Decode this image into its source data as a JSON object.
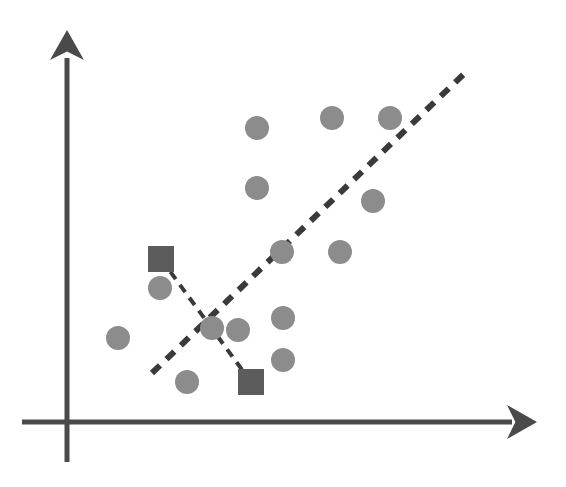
{
  "figure": {
    "background_color": "#ffffff",
    "width": 566,
    "height": 487
  },
  "colors": {
    "axis": "#4a4a4a",
    "dot": "#8c8c8c",
    "square": "#5c5c5c",
    "dash": "#3a3a3a",
    "background": "#ffffff"
  },
  "axes": {
    "x_axis": {
      "name": "horizontal-axis",
      "x1": 22,
      "y1": 422,
      "x2": 512,
      "y2": 422,
      "stroke_width": 5,
      "arrow_tip_x": 537,
      "arrow_tip_y": 422,
      "arrow_half_height": 17,
      "arrow_length": 30
    },
    "y_axis": {
      "name": "vertical-axis",
      "x1": 67,
      "y1": 462,
      "x2": 67,
      "y2": 58,
      "stroke_width": 5,
      "arrow_tip_x": 67,
      "arrow_tip_y": 30,
      "arrow_half_width": 17,
      "arrow_length": 30
    }
  },
  "chart_data": {
    "type": "scatter",
    "title": "",
    "xlabel": "",
    "ylabel": "",
    "grid": false,
    "legend": false,
    "xlim": [
      0,
      566
    ],
    "ylim": [
      487,
      0
    ],
    "note": "Pixel coordinates; y increases downward in screen space.",
    "series": [
      {
        "name": "data-points",
        "marker": "circle",
        "color": "#8c8c8c",
        "radius": 12,
        "count": 15,
        "points": [
          {
            "x": 118,
            "y": 338
          },
          {
            "x": 160,
            "y": 288
          },
          {
            "x": 187,
            "y": 382
          },
          {
            "x": 212,
            "y": 328
          },
          {
            "x": 238,
            "y": 330
          },
          {
            "x": 257,
            "y": 128
          },
          {
            "x": 257,
            "y": 188
          },
          {
            "x": 282,
            "y": 252
          },
          {
            "x": 283,
            "y": 318
          },
          {
            "x": 283,
            "y": 360
          },
          {
            "x": 332,
            "y": 118
          },
          {
            "x": 340,
            "y": 252
          },
          {
            "x": 373,
            "y": 201
          },
          {
            "x": 390,
            "y": 118
          }
        ]
      },
      {
        "name": "highlighted-markers",
        "marker": "square",
        "color": "#5c5c5c",
        "size": 26,
        "count": 2,
        "points": [
          {
            "x": 161,
            "y": 259,
            "label": "upper-left-square"
          },
          {
            "x": 251,
            "y": 382,
            "label": "lower-right-square"
          }
        ]
      }
    ],
    "lines": [
      {
        "name": "principal-direction-line",
        "style": "dashed",
        "color": "#3a3a3a",
        "stroke_width": 6,
        "dash_pattern": "11 9",
        "x1": 152,
        "y1": 373,
        "x2": 466,
        "y2": 72,
        "slope_description": "rising left-to-right"
      },
      {
        "name": "projection-segment",
        "style": "dashed",
        "color": "#3a3a3a",
        "stroke_width": 4,
        "dash_pattern": "9 7",
        "x1": 161,
        "y1": 259,
        "x2": 251,
        "y2": 382,
        "slope_description": "falling left-to-right, crosses principal line near (212,328)"
      }
    ],
    "annotations": []
  }
}
